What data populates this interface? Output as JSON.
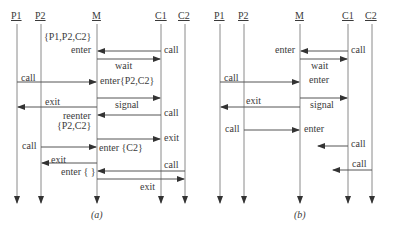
{
  "diagram_a": {
    "caption": "(a)",
    "lifelines": [
      {
        "name": "P1",
        "x": 17
      },
      {
        "name": "P2",
        "x": 41
      },
      {
        "name": "M",
        "x": 97
      },
      {
        "name": "C1",
        "x": 161
      },
      {
        "name": "C2",
        "x": 185
      }
    ],
    "labels": {
      "set_p1p2c2": "{P1,P2,C2}",
      "enter1": "enter",
      "call_c1": "call",
      "wait": "wait",
      "call_p1": "call",
      "enter_p2c2": "enter{P2,C2}",
      "exit_p1": "exit",
      "signal": "signal",
      "reenter": "reenter",
      "set_p2c2": "{P2,C2}",
      "call_c1_2": "call",
      "exit_c1": "exit",
      "call_p2": "call",
      "enter_c2": "enter {C2}",
      "exit_p2": "exit",
      "call_c2": "call",
      "enter_empty": "enter { }",
      "exit_c2": "exit"
    }
  },
  "diagram_b": {
    "caption": "(b)",
    "lifelines": [
      {
        "name": "P1",
        "x": 220
      },
      {
        "name": "P2",
        "x": 244
      },
      {
        "name": "M",
        "x": 300
      },
      {
        "name": "C1",
        "x": 348
      },
      {
        "name": "C2",
        "x": 372
      }
    ],
    "labels": {
      "enter1": "enter",
      "call_c1": "call",
      "wait": "wait",
      "call_p1": "call",
      "enter2": "enter",
      "exit_p1": "exit",
      "signal": "signal",
      "call_p2": "call",
      "enter3": "enter",
      "call_c1_2": "call",
      "call_c2": "call"
    }
  }
}
